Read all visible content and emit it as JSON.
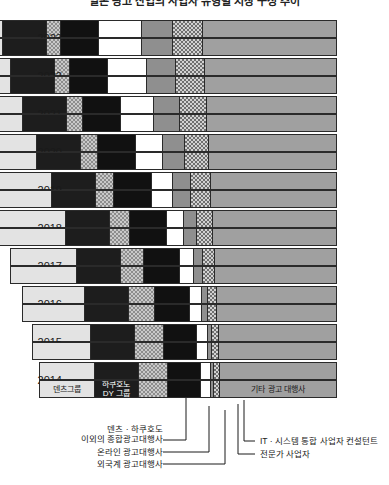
{
  "title": "일본 광고 산업의 사업자 유형별 시장 구성 추이",
  "axis": {
    "years": [
      "2023",
      "2022",
      "2021",
      "2020",
      "2019",
      "2018",
      "2017",
      "2016",
      "2015",
      "2014"
    ]
  },
  "segments": [
    {
      "key": "dentsu",
      "label": "덴츠그룹",
      "fill": "#e3e3e3",
      "text_tone": "light"
    },
    {
      "key": "hakuhodo",
      "label": "하쿠호도\nDY 그룹",
      "fill": "#1d1d1d",
      "text_tone": "dark"
    },
    {
      "key": "sogo",
      "label": "덴츠 · 하쿠호도 이외의 종합광고대행사",
      "fill": "#c9c9c9",
      "text_tone": "light"
    },
    {
      "key": "online",
      "label": "온라인 광고대행사",
      "fill": "#111111",
      "text_tone": "dark"
    },
    {
      "key": "foreign",
      "label": "외국계 광고대행사",
      "fill": "#ffffff",
      "text_tone": "light"
    },
    {
      "key": "it",
      "label": "IT · 시스템 통합 사업자 컨설턴트",
      "fill": "#8f8f8f",
      "text_tone": "light"
    },
    {
      "key": "expert",
      "label": "전문가 사업자",
      "fill": "#d2d2d2",
      "text_tone": "light"
    },
    {
      "key": "other",
      "label": "기타 광고 대행사",
      "fill": "#a0a0a0",
      "text_tone": "light"
    }
  ],
  "inchart_labels": {
    "dentsu": "덴츠그룹",
    "hakuhodo_line1": "하쿠호도",
    "hakuhodo_line2": "DY 그룹",
    "other": "기타 광고 대행사"
  },
  "callouts": {
    "sogo_line1": "덴츠 · 하쿠호도",
    "sogo_line2": "이외의 종합광고대행사",
    "online": "온라인 광고대행사",
    "foreign": "외국계 광고대행사",
    "it": "IT · 시스템 통합 사업자 컨설턴트",
    "expert": "전문가 사업자"
  },
  "chart_data": {
    "type": "bar",
    "orientation": "horizontal",
    "stacked": true,
    "title": "일본 광고 산업의 사업자 유형별 시장 구성 추이",
    "xlabel": "",
    "ylabel": "",
    "grid": false,
    "legend_position": "in-chart + callouts",
    "note": "Bars are right-aligned; total bar width grows from 2014 to 2023. Values are segment widths in plot units (px of the 389px-wide source image), x measured from the plot left edge at x=62. Two bars are drawn per year.",
    "categories": [
      "2014",
      "2015",
      "2016",
      "2017",
      "2018",
      "2019",
      "2020",
      "2021",
      "2022",
      "2023"
    ],
    "series": [
      {
        "name": "덴츠그룹",
        "key": "dentsu",
        "values": [
          55,
          58,
          62,
          66,
          72,
          76,
          80,
          84,
          88,
          90
        ]
      },
      {
        "name": "하쿠호도 DY 그룹",
        "key": "hakuhodo",
        "values": [
          44,
          44,
          44,
          44,
          44,
          44,
          44,
          44,
          44,
          44
        ]
      },
      {
        "name": "덴츠 · 하쿠호도 이외의 종합광고대행사",
        "key": "sogo",
        "values": [
          29,
          29,
          26,
          23,
          20,
          18,
          17,
          16,
          15,
          14
        ]
      },
      {
        "name": "온라인 광고대행사",
        "key": "online",
        "values": [
          34,
          34,
          36,
          37,
          38,
          38,
          38,
          38,
          38,
          38
        ]
      },
      {
        "name": "외국계 광고대행사",
        "key": "foreign",
        "values": [
          10,
          11,
          12,
          14,
          17,
          22,
          28,
          34,
          40,
          44
        ]
      },
      {
        "name": "IT · 시스템 통합 사업자 컨설턴트",
        "key": "it",
        "values": [
          3,
          4,
          6,
          9,
          13,
          18,
          22,
          26,
          29,
          31
        ]
      },
      {
        "name": "전문가 사업자",
        "key": "expert",
        "values": [
          6,
          7,
          9,
          12,
          16,
          20,
          24,
          27,
          29,
          30
        ]
      },
      {
        "name": "기타 광고 대행사",
        "key": "other",
        "values": [
          117,
          118,
          120,
          122,
          124,
          126,
          128,
          130,
          132,
          134
        ]
      }
    ]
  },
  "layout": {
    "plot_left": 62,
    "plot_right": 363,
    "bar_height": 18,
    "bars_per_year": 2
  }
}
